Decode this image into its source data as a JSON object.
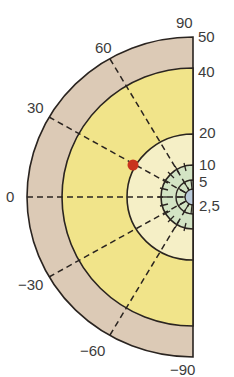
{
  "diagram": {
    "type": "semicircular-zone-diagram",
    "center": {
      "x": 193,
      "y": 197
    },
    "colors": {
      "outer_ring": "#dccab6",
      "yellow_zone": "#f1e48a",
      "cream_zone": "#f5efc6",
      "green_zone": "#d3e4c4",
      "blue_core": "#b9cad9",
      "marker": "#c8341e",
      "line": "#2a2420"
    },
    "angle_labels": [
      {
        "text": "90",
        "x": 176,
        "y": 15
      },
      {
        "text": "60",
        "x": 95,
        "y": 40
      },
      {
        "text": "30",
        "x": 27,
        "y": 100
      },
      {
        "text": "0",
        "x": 6,
        "y": 189
      },
      {
        "text": "−30",
        "x": 18,
        "y": 277
      },
      {
        "text": "−60",
        "x": 80,
        "y": 343
      },
      {
        "text": "−90",
        "x": 170,
        "y": 362
      }
    ],
    "radius_labels": [
      {
        "text": "50",
        "x": 198,
        "y": 29
      },
      {
        "text": "40",
        "x": 198,
        "y": 64
      },
      {
        "text": "20",
        "x": 199,
        "y": 125
      },
      {
        "text": "10",
        "x": 199,
        "y": 157
      },
      {
        "text": "5",
        "x": 199,
        "y": 174
      },
      {
        "text": "2,5",
        "x": 199,
        "y": 198
      }
    ],
    "marker": {
      "label": "red-point",
      "x": 133,
      "y": 165
    }
  }
}
